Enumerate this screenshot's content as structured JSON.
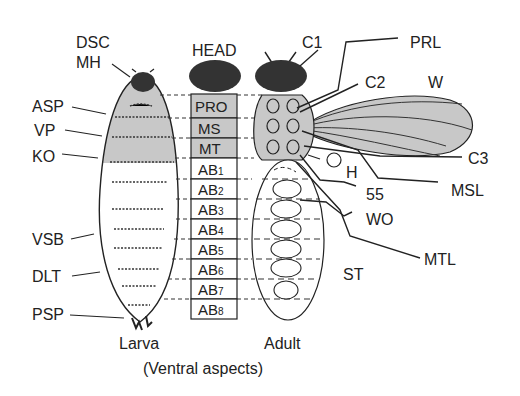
{
  "colors": {
    "shade": "#c8c8c8",
    "dark": "#333333",
    "line": "#222222",
    "background": "#ffffff"
  },
  "larva": {
    "caption": "Larva",
    "labels": {
      "dsc": "DSC",
      "mh": "MH",
      "asp": "ASP",
      "vp": "VP",
      "ko": "KO",
      "vsb": "VSB",
      "dlt": "DLT",
      "psp": "PSP"
    }
  },
  "segments": {
    "head": "HEAD",
    "items": [
      {
        "main": "PRO",
        "sub": ""
      },
      {
        "main": "MS",
        "sub": ""
      },
      {
        "main": "MT",
        "sub": ""
      },
      {
        "main": "AB",
        "sub": "1"
      },
      {
        "main": "AB",
        "sub": "2"
      },
      {
        "main": "AB",
        "sub": "3"
      },
      {
        "main": "AB",
        "sub": "4"
      },
      {
        "main": "AB",
        "sub": "5"
      },
      {
        "main": "AB",
        "sub": "6"
      },
      {
        "main": "AB",
        "sub": "7"
      },
      {
        "main": "AB",
        "sub": "8"
      }
    ]
  },
  "adult": {
    "caption": "Adult",
    "labels": {
      "c1": "C1",
      "prl": "PRL",
      "c2": "C2",
      "w": "W",
      "c3": "C3",
      "h": "H",
      "msl": "MSL",
      "n55": "55",
      "wo": "WO",
      "mtl": "MTL",
      "st": "ST"
    }
  },
  "caption": "(Ventral aspects)"
}
